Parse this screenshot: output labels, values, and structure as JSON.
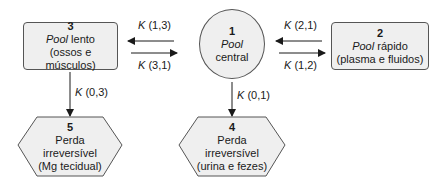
{
  "nodes": {
    "n1": {
      "number": "1",
      "line1_italic": "Pool",
      "line1_rest": "",
      "line2": "central"
    },
    "n2": {
      "number": "2",
      "line1_italic": "Pool",
      "line1_rest": " rápido",
      "line2": "(plasma e fluidos)"
    },
    "n3": {
      "number": "3",
      "line1_italic": "Pool",
      "line1_rest": " lento",
      "line2": "(ossos e músculos)"
    },
    "n4": {
      "number": "4",
      "line1": "Perda",
      "line2": "irreversível",
      "line3": "(urina e fezes)"
    },
    "n5": {
      "number": "5",
      "line1": "Perda",
      "line2": "irreversível",
      "line3": "(Mg tecidual)"
    }
  },
  "edges": {
    "k13": {
      "k": "K",
      "idx": " (1,3)"
    },
    "k31": {
      "k": "K",
      "idx": " (3,1)"
    },
    "k21": {
      "k": "K",
      "idx": " (2,1)"
    },
    "k12": {
      "k": "K",
      "idx": " (1,2)"
    },
    "k03": {
      "k": "K",
      "idx": " (0,3)"
    },
    "k01": {
      "k": "K",
      "idx": " (0,1)"
    }
  },
  "colors": {
    "fill": "#efefef",
    "stroke": "#555555",
    "arrow": "#1a1a1a"
  }
}
